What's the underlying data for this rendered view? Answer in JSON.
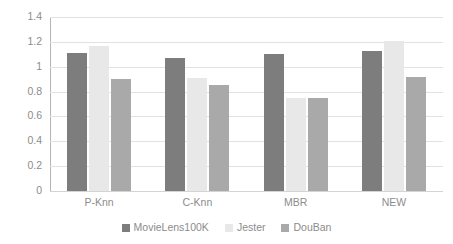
{
  "chart_data": {
    "type": "bar",
    "title": "",
    "subtitle": "",
    "xlabel": "",
    "ylabel": "",
    "categories": [
      "P-Knn",
      "C-Knn",
      "MBR",
      "NEW"
    ],
    "series": [
      {
        "name": "MovieLens100K",
        "color": "#7d7d7d",
        "values": [
          1.11,
          1.07,
          1.1,
          1.13
        ]
      },
      {
        "name": "Jester",
        "color": "#e8e8e8",
        "values": [
          1.17,
          0.91,
          0.75,
          1.21
        ]
      },
      {
        "name": "DouBan",
        "color": "#a9a9a9",
        "values": [
          0.9,
          0.85,
          0.75,
          0.92
        ]
      }
    ],
    "ylim": [
      0,
      1.4
    ],
    "ytick_step": 0.2,
    "ytick_labels": [
      "0",
      "0.2",
      "0.4",
      "0.6",
      "0.8",
      "1",
      "1.2",
      "1.4"
    ],
    "ytick_values": [
      0,
      0.2,
      0.4,
      0.6,
      0.8,
      1.0,
      1.2,
      1.4
    ],
    "grid": true,
    "grid_color": "#e2e2e2",
    "legend_position": "bottom",
    "background": "#ffffff"
  }
}
